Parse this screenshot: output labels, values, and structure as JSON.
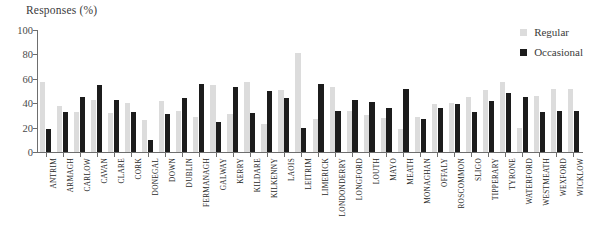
{
  "chart_data": {
    "type": "bar",
    "title": "Responses (%)",
    "xlabel": "",
    "ylabel": "Responses (%)",
    "ylim": [
      0,
      100
    ],
    "y_ticks": [
      0,
      20,
      40,
      60,
      80,
      100
    ],
    "grid": false,
    "legend_position": "top-right",
    "categories": [
      "ANTRIM",
      "ARMAGH",
      "CARLOW",
      "CAVAN",
      "CLARE",
      "CORK",
      "DONEGAL",
      "DOWN",
      "DUBLIN",
      "FERMANAGH",
      "GALWAY",
      "KERRY",
      "KILDARE",
      "KILKENNY",
      "LAOIS",
      "LEITRIM",
      "LIMERICK",
      "LONDONDERRY",
      "LONGFORD",
      "LOUTH",
      "MAYO",
      "MEATH",
      "MONAGHAN",
      "OFFALY",
      "ROSCOMMON",
      "SLIGO",
      "TIPPERARY",
      "TYRONE",
      "WATERFORD",
      "WESTMEATH",
      "WEXFORD",
      "WICKLOW"
    ],
    "series": [
      {
        "name": "Regular",
        "color": "#dcdcdc",
        "values": [
          57,
          38,
          33,
          43,
          32,
          40,
          26,
          42,
          34,
          29,
          55,
          31,
          57,
          23,
          51,
          81,
          27,
          53,
          34,
          30,
          28,
          19,
          29,
          39,
          40,
          45,
          51,
          57,
          20,
          46,
          52,
          52
        ]
      },
      {
        "name": "Occasional",
        "color": "#1c1c1c",
        "values": [
          19,
          33,
          45,
          55,
          43,
          33,
          10,
          31,
          44,
          56,
          25,
          53,
          32,
          50,
          44,
          20,
          56,
          34,
          43,
          41,
          36,
          52,
          27,
          36,
          39,
          33,
          42,
          48,
          45,
          33,
          34,
          34
        ]
      }
    ]
  },
  "legend": {
    "items": [
      {
        "label": "Regular"
      },
      {
        "label": "Occasional"
      }
    ]
  }
}
